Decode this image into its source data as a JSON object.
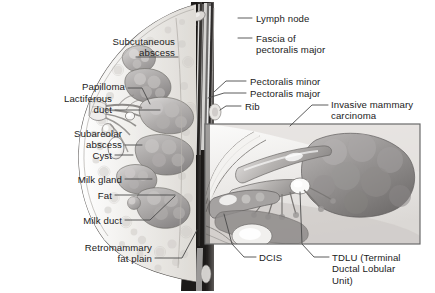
{
  "figure": {
    "type": "medical-illustration",
    "style": "grayscale line-and-tone drawing",
    "background_color": "#ffffff",
    "ink_color": "#1b1b1b",
    "leader_line_color": "#4a4a4a"
  },
  "labels_left": [
    {
      "id": "subcutaneous-abscess",
      "text": "Subcutaneous\nabscess",
      "x": 175,
      "y": 36,
      "align": "right"
    },
    {
      "id": "papilloma",
      "text": "Papilloma",
      "x": 125,
      "y": 86,
      "align": "right"
    },
    {
      "id": "lactiferous-duct",
      "text": "Lactiferous\nduct",
      "x": 112,
      "y": 98,
      "align": "right"
    },
    {
      "id": "subareolar-abscess",
      "text": "Subareolar\nabscess",
      "x": 122,
      "y": 129,
      "align": "right"
    },
    {
      "id": "cyst",
      "text": "Cyst",
      "x": 112,
      "y": 152,
      "align": "right"
    },
    {
      "id": "milk-gland",
      "text": "Milk gland",
      "x": 122,
      "y": 176,
      "align": "right"
    },
    {
      "id": "fat",
      "text": "Fat",
      "x": 112,
      "y": 192,
      "align": "right"
    },
    {
      "id": "milk-duct",
      "text": "Milk duct",
      "x": 122,
      "y": 217,
      "align": "right"
    },
    {
      "id": "retromammary-fat-plain",
      "text": "Retromammary\nfat plain",
      "x": 152,
      "y": 244,
      "align": "right"
    }
  ],
  "labels_right": [
    {
      "id": "lymph-node",
      "text": "Lymph node",
      "x": 256,
      "y": 15,
      "align": "left"
    },
    {
      "id": "fascia-of-pectoralis-major",
      "text": "Fascia of\npectoralis major",
      "x": 256,
      "y": 35,
      "align": "left"
    },
    {
      "id": "pectoralis-minor",
      "text": "Pectoralis minor",
      "x": 250,
      "y": 78,
      "align": "left"
    },
    {
      "id": "pectoralis-major",
      "text": "Pectoralis major",
      "x": 250,
      "y": 90,
      "align": "left"
    },
    {
      "id": "rib",
      "text": "Rib",
      "x": 245,
      "y": 103,
      "align": "left"
    },
    {
      "id": "invasive-mammary-carcinoma",
      "text": "Invasive mammary\ncarcinoma",
      "x": 331,
      "y": 101,
      "align": "left"
    },
    {
      "id": "dcis",
      "text": "DCIS",
      "x": 259,
      "y": 254,
      "align": "left"
    },
    {
      "id": "tdlu",
      "text": "TDLU (Terminal\nDuctal Lobular\nUnit)",
      "x": 332,
      "y": 254,
      "align": "left"
    }
  ],
  "inset_panel": {
    "id": "magnified-detail-inset",
    "x": 204,
    "y": 123,
    "width": 217,
    "height": 122,
    "border_color": "#6b6b6b",
    "description": "Magnified view of terminal ductal lobular unit, DCIS and invasive carcinoma"
  },
  "anatomy_regions": [
    {
      "id": "skin-outline",
      "label": "skin and subcutaneous contour"
    },
    {
      "id": "nipple-areola",
      "label": "nipple and areola"
    },
    {
      "id": "glandular-lobules",
      "label": "glandular lobules"
    },
    {
      "id": "chest-wall-muscle",
      "label": "pectoralis muscle layer"
    },
    {
      "id": "rib-cage",
      "label": "rib"
    }
  ]
}
